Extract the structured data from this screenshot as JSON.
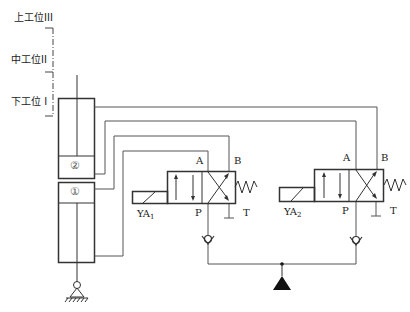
{
  "diagram": {
    "type": "hydraulic-circuit",
    "positions": {
      "upper": "上工位III",
      "middle": "中工位II",
      "lower": "下工位 I"
    },
    "cylinders": {
      "upper_label": "②",
      "lower_label": "①"
    },
    "valve1": {
      "port_a": "A",
      "port_b": "B",
      "port_p": "P",
      "port_t": "T",
      "solenoid": "YA",
      "solenoid_sub": "1"
    },
    "valve2": {
      "port_a": "A",
      "port_b": "B",
      "port_p": "P",
      "port_t": "T",
      "solenoid": "YA",
      "solenoid_sub": "2"
    },
    "colors": {
      "line": "#555555",
      "heavy": "#333333",
      "fill": "#111111"
    }
  }
}
